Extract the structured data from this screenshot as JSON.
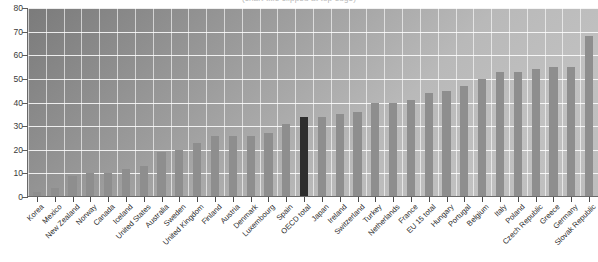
{
  "chart": {
    "title_clipped": "(chart title clipped at top edge)",
    "ylabel": "",
    "xlabel": ""
  },
  "chart_data": {
    "type": "bar",
    "title": "",
    "xlabel": "",
    "ylabel": "",
    "ylim": [
      0,
      80
    ],
    "yticks": [
      0,
      10,
      20,
      30,
      40,
      50,
      60,
      70,
      80
    ],
    "grid": true,
    "legend": "none",
    "highlight_category": "OECD total",
    "highlight_color": "#2e2e2e",
    "bar_color": "#8e8e8e",
    "categories": [
      "Korea",
      "Mexico",
      "New Zealand",
      "Norway",
      "Canada",
      "Iceland",
      "United States",
      "Australia",
      "Sweden",
      "United Kingdom",
      "Finland",
      "Austria",
      "Denmark",
      "Luxembourg",
      "Spain",
      "OECD total",
      "Japan",
      "Ireland",
      "Switzerland",
      "Turkey",
      "Netherlands",
      "France",
      "EU 15 total",
      "Hungary",
      "Portugal",
      "Belgium",
      "Italy",
      "Poland",
      "Czech Republic",
      "Greece",
      "Germany",
      "Slovak Republic"
    ],
    "values": [
      2,
      4,
      9,
      10,
      10,
      12,
      13,
      19,
      20,
      23,
      26,
      26,
      26,
      27,
      31,
      34,
      34,
      35,
      36,
      40,
      40,
      41,
      44,
      45,
      47,
      50,
      53,
      53,
      54,
      55,
      55,
      68
    ]
  }
}
